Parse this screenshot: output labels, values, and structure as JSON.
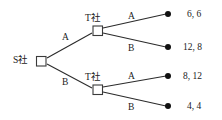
{
  "diagram": {
    "type": "extensive-form-game-tree",
    "colors": {
      "background": "#ffffff",
      "edge": "#2b2b2b",
      "node_stroke": "#3a3a3a",
      "node_fill": "#ffffff",
      "terminal_fill": "#111111",
      "text": "#222222"
    },
    "nodes": [
      {
        "id": "root",
        "player_label": "S社",
        "shape": "square",
        "x": 41,
        "y": 61
      },
      {
        "id": "t-upper",
        "player_label": "T社",
        "shape": "square",
        "x": 97.5,
        "y": 30.5
      },
      {
        "id": "t-lower",
        "player_label": "T社",
        "shape": "square",
        "x": 97.5,
        "y": 89.5
      }
    ],
    "edges": [
      {
        "from": "root",
        "to": "t-upper",
        "action": "A"
      },
      {
        "from": "root",
        "to": "t-lower",
        "action": "B"
      },
      {
        "from": "t-upper",
        "to": "leaf-1",
        "action": "A"
      },
      {
        "from": "t-upper",
        "to": "leaf-2",
        "action": "B"
      },
      {
        "from": "t-lower",
        "to": "leaf-3",
        "action": "A"
      },
      {
        "from": "t-lower",
        "to": "leaf-4",
        "action": "B"
      }
    ],
    "leaves": [
      {
        "id": "leaf-1",
        "x": 168,
        "y": 14,
        "payoff": "6, 6"
      },
      {
        "id": "leaf-2",
        "x": 168,
        "y": 47,
        "payoff": "12, 8"
      },
      {
        "id": "leaf-3",
        "x": 168,
        "y": 76,
        "payoff": "8, 12"
      },
      {
        "id": "leaf-4",
        "x": 168,
        "y": 106,
        "payoff": "4, 4"
      }
    ],
    "labels": {
      "root_player": "S社",
      "upper_player": "T社",
      "lower_player": "T社",
      "root_action_upper": "A",
      "root_action_lower": "B",
      "upper_action_a": "A",
      "upper_action_b": "B",
      "lower_action_a": "A",
      "lower_action_b": "B",
      "payoff_1": "6, 6",
      "payoff_2": "12, 8",
      "payoff_3": "8, 12",
      "payoff_4": "4, 4"
    }
  }
}
